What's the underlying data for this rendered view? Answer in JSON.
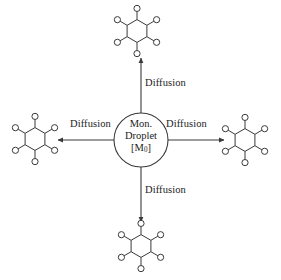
{
  "diagram": {
    "background_color": "#ffffff",
    "line_color": "#3a3a3a",
    "text_color": "#1a1a1a",
    "center": {
      "shape": "circle",
      "label_line_1": "Mon.",
      "label_line_2": "Droplet",
      "label_line_3_prefix": "[M",
      "label_line_3_subscript": "0",
      "label_line_3_suffix": "]",
      "label_full": "Mon. Droplet [M0]",
      "cx": 141,
      "cy": 140,
      "r": 27
    },
    "arrows": [
      {
        "name": "arrow-up",
        "direction": "up",
        "label": "Diffusion",
        "from": [
          141,
          113
        ],
        "to": [
          141,
          58
        ]
      },
      {
        "name": "arrow-right",
        "direction": "right",
        "label": "Diffusion",
        "from": [
          168,
          140
        ],
        "to": [
          224,
          140
        ]
      },
      {
        "name": "arrow-down",
        "direction": "down",
        "label": "Diffusion",
        "from": [
          141,
          167
        ],
        "to": [
          141,
          222
        ]
      },
      {
        "name": "arrow-left",
        "direction": "left",
        "label": "Diffusion",
        "from": [
          114,
          140
        ],
        "to": [
          58,
          140
        ]
      }
    ],
    "labels": {
      "up": "Diffusion",
      "right": "Diffusion",
      "down": "Diffusion",
      "left": "Diffusion"
    },
    "molecules": [
      {
        "name": "molecule-top",
        "cx": 137,
        "cy": 31,
        "ring": "hexagon",
        "substituents": 6,
        "substituent_shape": "circle"
      },
      {
        "name": "molecule-right",
        "cx": 245,
        "cy": 140,
        "ring": "hexagon",
        "substituents": 6,
        "substituent_shape": "circle"
      },
      {
        "name": "molecule-bottom",
        "cx": 141,
        "cy": 246,
        "ring": "hexagon",
        "substituents": 6,
        "substituent_shape": "circle"
      },
      {
        "name": "molecule-left",
        "cx": 35,
        "cy": 139,
        "ring": "hexagon",
        "substituents": 6,
        "substituent_shape": "circle"
      }
    ]
  }
}
